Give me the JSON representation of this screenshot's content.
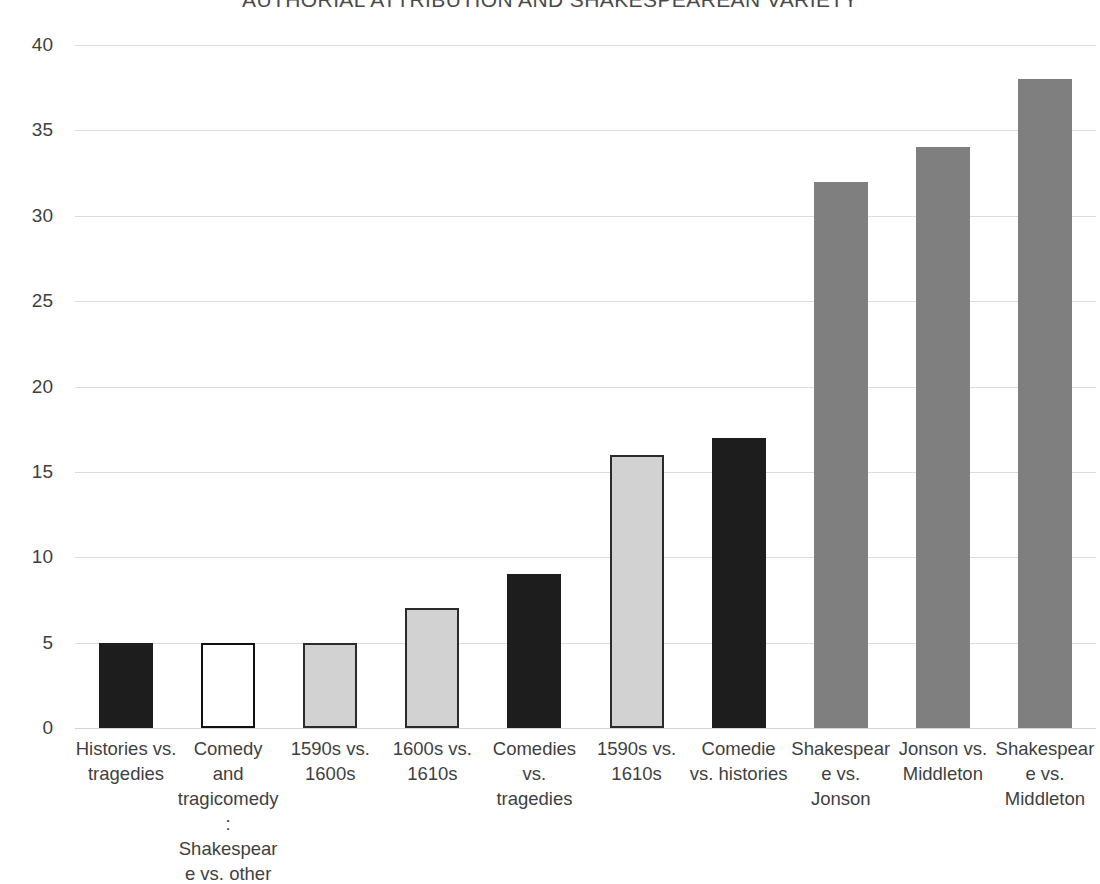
{
  "chart_data": {
    "type": "bar",
    "title": "AUTHORIAL ATTRIBUTION AND SHAKESPEAREAN VARIETY",
    "xlabel": "",
    "ylabel": "",
    "ylim": [
      0,
      40
    ],
    "ytick_step": 5,
    "yticks": [
      "40",
      "35",
      "30",
      "25",
      "20",
      "15",
      "10",
      "5",
      "0"
    ],
    "grid": true,
    "legend": "none",
    "categories": [
      "Histories vs. tragedies",
      "Comedy and tragicomedy: Shakespeare vs. other",
      "1590s vs. 1600s",
      "1600s vs. 1610s",
      "Comedies vs. tragedies",
      "1590s vs. 1610s",
      "Comedie vs. histories",
      "Shakespeare vs. Jonson",
      "Jonson vs. Middleton",
      "Shakespeare vs. Middleton"
    ],
    "values": [
      5,
      5,
      5,
      7,
      9,
      16,
      17,
      32,
      34,
      38
    ],
    "bar_styles": [
      "dark",
      "outline",
      "lightgray",
      "lightgray",
      "dark",
      "lightgray",
      "dark",
      "midgray",
      "midgray",
      "midgray"
    ]
  },
  "colors": {
    "dark": "#1d1d1d",
    "outline_fill": "#ffffff",
    "outline_stroke": "#111111",
    "lightgray_fill": "#d2d2d2",
    "lightgray_stroke": "#2b2b2b",
    "midgray": "#7f7f7f",
    "gridline": "#dcdcdc",
    "text": "#3f3f3f",
    "background": "#ffffff"
  }
}
